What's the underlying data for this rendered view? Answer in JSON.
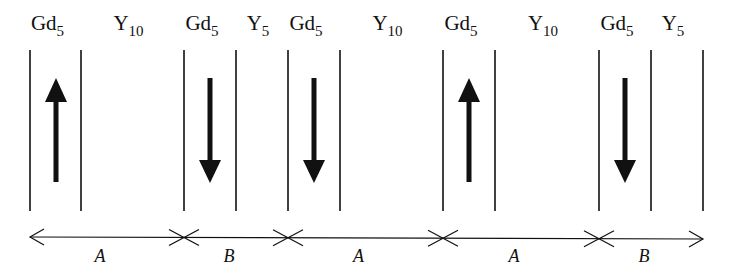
{
  "diagram": {
    "layers": [
      {
        "element": "Gd",
        "count": "5",
        "moment": "up",
        "x1": 30,
        "x2": 81
      },
      {
        "element": "Y",
        "count": "10",
        "x1": 81,
        "x2": 184
      },
      {
        "element": "Gd",
        "count": "5",
        "moment": "down",
        "x1": 184,
        "x2": 236
      },
      {
        "element": "Y",
        "count": "5",
        "x1": 236,
        "x2": 288
      },
      {
        "element": "Gd",
        "count": "5",
        "moment": "down",
        "x1": 288,
        "x2": 340
      },
      {
        "element": "Y",
        "count": "10",
        "x1": 340,
        "x2": 443
      },
      {
        "element": "Gd",
        "count": "5",
        "moment": "up",
        "x1": 443,
        "x2": 495
      },
      {
        "element": "Y",
        "count": "10",
        "x1": 495,
        "x2": 599
      },
      {
        "element": "Gd",
        "count": "5",
        "moment": "down",
        "x1": 599,
        "x2": 651
      },
      {
        "element": "Y",
        "count": "5",
        "x1": 651,
        "x2": 703
      }
    ],
    "segments": [
      {
        "label": "A",
        "from": 30,
        "to": 184
      },
      {
        "label": "B",
        "from": 184,
        "to": 288
      },
      {
        "label": "A",
        "from": 288,
        "to": 443
      },
      {
        "label": "A",
        "from": 443,
        "to": 599
      },
      {
        "label": "B",
        "from": 599,
        "to": 703
      }
    ],
    "colors": {
      "line": "#111111",
      "background": "#ffffff"
    }
  }
}
